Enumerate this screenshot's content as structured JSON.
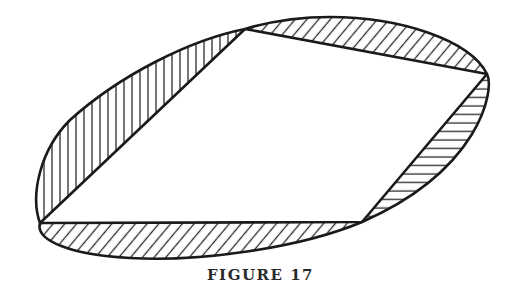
{
  "figure": {
    "caption": "FIGURE 17",
    "colors": {
      "stroke": "#1a1a1a",
      "background": "#ffffff",
      "hatch": "#2a2a2a"
    },
    "quadrilateral_vertices": [
      {
        "name": "top",
        "x": 245,
        "y": 29
      },
      {
        "name": "right",
        "x": 487,
        "y": 74
      },
      {
        "name": "bottom-right",
        "x": 362,
        "y": 222
      },
      {
        "name": "left",
        "x": 40,
        "y": 223
      }
    ],
    "hatched_segments": [
      {
        "name": "left-segment",
        "hatch": "vertical"
      },
      {
        "name": "top-segment",
        "hatch": "diagonal"
      },
      {
        "name": "right-segment",
        "hatch": "horizontal"
      },
      {
        "name": "bottom-segment",
        "hatch": "diagonal"
      }
    ]
  }
}
